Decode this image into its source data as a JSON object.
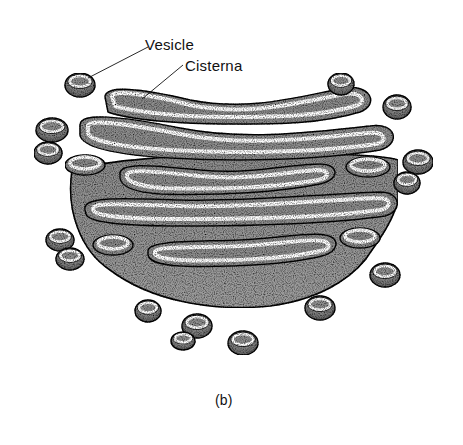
{
  "figure": {
    "labels": {
      "vesicle": "Vesicle",
      "cisterna": "Cisterna"
    },
    "caption": "(b)",
    "colors": {
      "background": "#ffffff",
      "fill": "#9a9a9a",
      "fill_dark": "#6e6e6e",
      "outline": "#111111",
      "lumen_rim": "#ffffff"
    },
    "vesicles": [
      {
        "cx": 80,
        "cy": 85,
        "rx": 15,
        "ry": 12
      },
      {
        "cx": 52,
        "cy": 130,
        "rx": 16,
        "ry": 12
      },
      {
        "cx": 48,
        "cy": 153,
        "rx": 14,
        "ry": 11
      },
      {
        "cx": 60,
        "cy": 240,
        "rx": 14,
        "ry": 11
      },
      {
        "cx": 70,
        "cy": 259,
        "rx": 14,
        "ry": 11
      },
      {
        "cx": 341,
        "cy": 84,
        "rx": 13,
        "ry": 11
      },
      {
        "cx": 397,
        "cy": 107,
        "rx": 14,
        "ry": 12
      },
      {
        "cx": 418,
        "cy": 162,
        "rx": 15,
        "ry": 12
      },
      {
        "cx": 407,
        "cy": 183,
        "rx": 13,
        "ry": 11
      },
      {
        "cx": 385,
        "cy": 275,
        "rx": 15,
        "ry": 12
      },
      {
        "cx": 148,
        "cy": 311,
        "rx": 13,
        "ry": 11
      },
      {
        "cx": 197,
        "cy": 326,
        "rx": 15,
        "ry": 12
      },
      {
        "cx": 183,
        "cy": 341,
        "rx": 12,
        "ry": 9
      },
      {
        "cx": 243,
        "cy": 343,
        "rx": 15,
        "ry": 12
      },
      {
        "cx": 320,
        "cy": 308,
        "rx": 15,
        "ry": 12
      }
    ]
  }
}
